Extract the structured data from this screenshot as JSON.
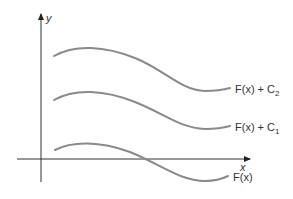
{
  "diagram": {
    "axes": {
      "x_label": "x",
      "y_label": "y"
    },
    "curves": [
      {
        "label": "F(x) + C",
        "subscript": "2",
        "color": "#8a8a8a"
      },
      {
        "label": "F(x) + C",
        "subscript": "1",
        "color": "#8a8a8a"
      },
      {
        "label": "F(x)",
        "subscript": "",
        "color": "#8a8a8a"
      }
    ]
  }
}
